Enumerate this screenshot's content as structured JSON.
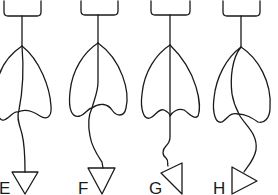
{
  "figure": {
    "type": "line-drawing",
    "stroke_color": "#1a1a1a",
    "background": "#ffffff",
    "panels": [
      {
        "label": "E",
        "tip_orientation": "pointing down",
        "wire": "crosses heart from apex, exits lower-left notch"
      },
      {
        "label": "F",
        "tip_orientation": "pointing down",
        "wire": "runs down center, bends left then exits bottom notch"
      },
      {
        "label": "G",
        "tip_orientation": "rotated, pointing down-right",
        "wire": "straight through center, wavy below heart"
      },
      {
        "label": "H",
        "tip_orientation": "pointing right",
        "wire": "curves left inside heart, then sweeps right below"
      }
    ]
  }
}
